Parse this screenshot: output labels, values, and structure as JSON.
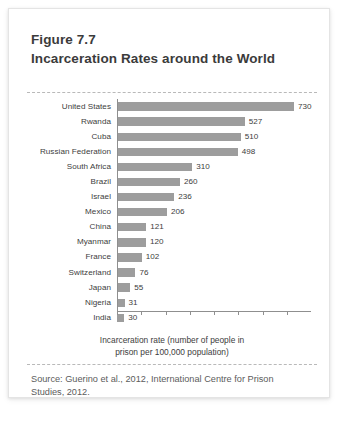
{
  "figure": {
    "number": "Figure 7.7",
    "title": "Incarceration Rates around the World",
    "axis_caption_line1": "Incarceration rate (number of people in",
    "axis_caption_line2": "prison per 100,000 population)",
    "source_line1": "Source: Guerino et al., 2012, International Centre for Prison",
    "source_line2": "Studies, 2012.",
    "bar_color": "#9d9d9d",
    "axis_color": "#8f8f8f",
    "text_color": "#3d3d3d"
  },
  "chart_data": {
    "type": "bar",
    "orientation": "horizontal",
    "title": "Incarceration Rates around the World",
    "xlabel": "Incarceration rate (number of people in prison per 100,000 population)",
    "ylabel": "",
    "xlim": [
      0,
      800
    ],
    "xticks": [
      0,
      100,
      200,
      300,
      400,
      500,
      600,
      700
    ],
    "grid": false,
    "legend": null,
    "data_labels": true,
    "categories": [
      "United States",
      "Rwanda",
      "Cuba",
      "Russian Federation",
      "South Africa",
      "Brazil",
      "Israel",
      "Mexico",
      "China",
      "Myanmar",
      "France",
      "Switzerland",
      "Japan",
      "Nigeria",
      "India"
    ],
    "values": [
      730,
      527,
      510,
      498,
      310,
      260,
      236,
      206,
      121,
      120,
      102,
      76,
      55,
      31,
      30
    ],
    "value_labels": [
      "730",
      "527",
      "510",
      "498",
      "310",
      "260",
      "236",
      "206",
      "121",
      "120",
      "102",
      "76",
      "55",
      "31",
      "30"
    ]
  }
}
